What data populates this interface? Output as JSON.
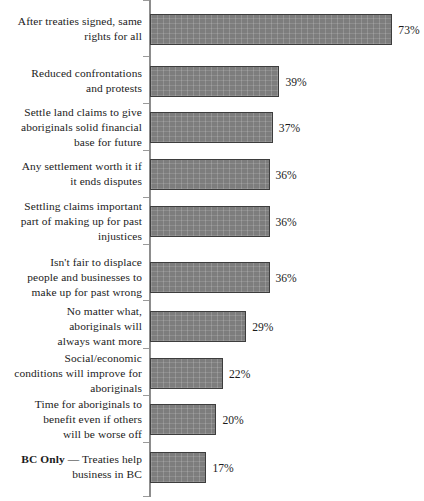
{
  "chart_data": {
    "type": "bar",
    "orientation": "horizontal",
    "title": "",
    "subtitle": "",
    "xlabel": "",
    "ylabel": "",
    "xlim": [
      0,
      73
    ],
    "grid": false,
    "legend": null,
    "value_suffix": "%",
    "categories": [
      "After treaties signed, same rights for all",
      "Reduced confrontations and protests",
      "Settle land claims to give aboriginals solid financial base for future",
      "Any settlement worth it if it ends disputes",
      "Settling claims important part of making up for past injustices",
      "Isn't fair to displace people and businesses to make up for past wrong",
      "No matter what, aboriginals will always want more",
      "Social/economic conditions will improve for aboriginals",
      "Time for aboriginals to benefit even if others will be worse off",
      "BC Only — Treaties help business in BC"
    ],
    "values": [
      73,
      39,
      37,
      36,
      36,
      36,
      29,
      22,
      20,
      17
    ],
    "value_labels": [
      "73%",
      "39%",
      "37%",
      "36%",
      "36%",
      "36%",
      "29%",
      "22%",
      "20%",
      "17%"
    ]
  },
  "rows": [
    {
      "label_lines": [
        "After treaties signed, same",
        "rights for all"
      ],
      "lead": "",
      "value": "73%"
    },
    {
      "label_lines": [
        "Reduced confrontations",
        "and protests"
      ],
      "lead": "",
      "value": "39%"
    },
    {
      "label_lines": [
        "Settle land claims to give",
        "aboriginals solid financial",
        "base for future"
      ],
      "lead": "",
      "value": "37%"
    },
    {
      "label_lines": [
        "Any settlement worth it if",
        "it ends disputes"
      ],
      "lead": "",
      "value": "36%"
    },
    {
      "label_lines": [
        "Settling claims important",
        "part of making up for past",
        "injustices"
      ],
      "lead": "",
      "value": "36%"
    },
    {
      "label_lines": [
        "Isn't fair to displace",
        "people and businesses to",
        "make up for past wrong"
      ],
      "lead": "",
      "value": "36%"
    },
    {
      "label_lines": [
        "No matter what,",
        "aboriginals will",
        "always want more"
      ],
      "lead": "",
      "value": "29%"
    },
    {
      "label_lines": [
        "Social/economic",
        "conditions will improve for",
        "aboriginals"
      ],
      "lead": "",
      "value": "22%"
    },
    {
      "label_lines": [
        "Time for aboriginals to",
        "benefit even if others",
        "will be worse off"
      ],
      "lead": "",
      "value": "20%"
    },
    {
      "label_lines": [
        " — Treaties help",
        "business in BC"
      ],
      "lead": "BC Only",
      "value": "17%"
    }
  ],
  "style": {
    "bar_fill": "#7d7d7d",
    "bar_border": "#3d3d3d",
    "axis_color": "#8d8d8d",
    "text_color": "#1b1b1b",
    "background": "#ffffff"
  },
  "geometry": {
    "axis_x": 150,
    "px_per_percent": 3.32,
    "bar_height": 31,
    "row_tops": [
      14,
      66,
      112,
      159,
      206,
      262,
      311,
      358,
      404,
      452
    ],
    "label_centers": [
      29.5,
      81.5,
      127.5,
      174.5,
      221.5,
      277.5,
      326.5,
      373.5,
      419.5,
      467.5
    ],
    "tick_ys": [
      0,
      56,
      103,
      150,
      197,
      244,
      300,
      348,
      395,
      442,
      496
    ]
  }
}
